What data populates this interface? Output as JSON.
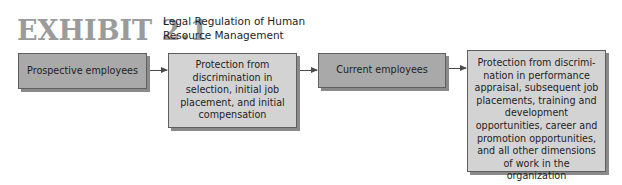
{
  "header": {
    "exhibit_label": "EXHIBIT 2.1",
    "title": "Legal Regulation of Human Resource Management"
  },
  "diagram": {
    "type": "flowchart",
    "direction": "left-to-right",
    "nodes": [
      {
        "id": "box1",
        "label": "Prospective employees",
        "fill": "#a9a9a9"
      },
      {
        "id": "box2",
        "label": "Protection from discrimination in selection, initial job placement, and initial compensation",
        "fill": "#d3d3d3"
      },
      {
        "id": "box3",
        "label": "Current employees",
        "fill": "#a9a9a9"
      },
      {
        "id": "box4",
        "label": "Protection from discrimi-nation in performance appraisal, subsequent job placements, training and development opportunities, career and promotion opportunities, and all other dimensions of work in the organization",
        "fill": "#d3d3d3"
      }
    ],
    "edges": [
      {
        "from": "box1",
        "to": "box2"
      },
      {
        "from": "box2",
        "to": "box3"
      },
      {
        "from": "box3",
        "to": "box4"
      }
    ]
  },
  "colors": {
    "exhibit_label": "#9b9b9b",
    "dark_box": "#a9a9a9",
    "light_box": "#d3d3d3",
    "border": "#5f5f5f",
    "shadow": "#8a8a8a",
    "arrow": "#4a4a4a"
  }
}
